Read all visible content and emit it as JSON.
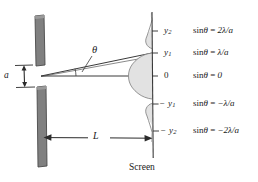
{
  "figure": {
    "screen_label": "Screen",
    "slit_width_label": "a",
    "distance_label": "L",
    "angle_label": "θ",
    "colors": {
      "barrier_fill": "#808080",
      "barrier_stroke": "#4a4a4a",
      "curve_fill": "#e2e2e2",
      "curve_stroke": "#8a8a8a",
      "line": "#3a3a3a",
      "text": "#1a1a1a",
      "background": "#ffffff"
    }
  },
  "positions": [
    {
      "id": "y2-pos",
      "y_label": "y",
      "y_sub": "2",
      "sign": "",
      "equation": "sinθ = 2λ/a",
      "eq_parts": {
        "sin": "sin",
        "theta": "θ",
        "eq": " = ",
        "value": "2λ/a"
      },
      "order": 2,
      "sin_theta_value": "2λ/a"
    },
    {
      "id": "y1-pos",
      "y_label": "y",
      "y_sub": "1",
      "sign": "",
      "equation": "sinθ = λ/a",
      "eq_parts": {
        "sin": "sin",
        "theta": "θ",
        "eq": " = ",
        "value": "λ/a"
      },
      "order": 1,
      "sin_theta_value": "λ/a"
    },
    {
      "id": "center",
      "y_label": "0",
      "y_sub": "",
      "sign": "",
      "equation": "sinθ = 0",
      "eq_parts": {
        "sin": "sin",
        "theta": "θ",
        "eq": " = ",
        "value": "0"
      },
      "order": 0,
      "sin_theta_value": "0"
    },
    {
      "id": "y1-neg",
      "y_label": "y",
      "y_sub": "1",
      "sign": "−",
      "equation": "sinθ = −λ/a",
      "eq_parts": {
        "sin": "sin",
        "theta": "θ",
        "eq": " = ",
        "value": "−λ/a"
      },
      "order": -1,
      "sin_theta_value": "−λ/a"
    },
    {
      "id": "y2-neg",
      "y_label": "y",
      "y_sub": "2",
      "sign": "−",
      "equation": "sinθ = −2λ/a",
      "eq_parts": {
        "sin": "sin",
        "theta": "θ",
        "eq": " = ",
        "value": "−2λ/a"
      },
      "order": -2,
      "sin_theta_value": "−2λ/a"
    }
  ]
}
